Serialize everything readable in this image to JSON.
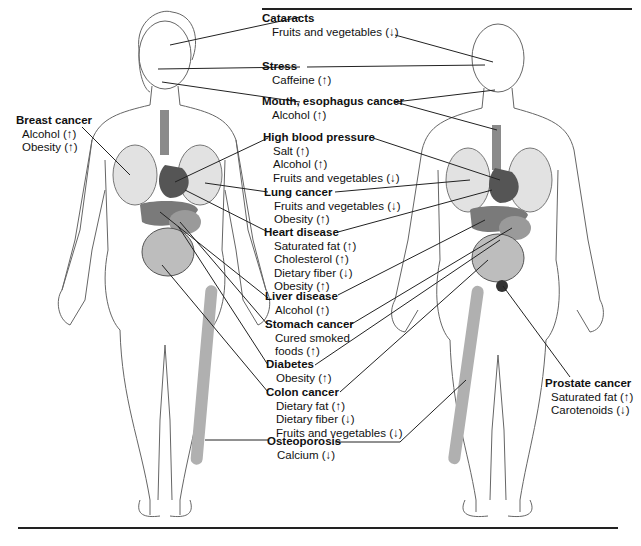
{
  "diagram": {
    "top_rule": true,
    "bottom_rule": true,
    "figures": [
      "female-body",
      "male-body"
    ],
    "arrow_legend": {
      "up": "↑",
      "down": "↓"
    },
    "labels": [
      {
        "id": "cataracts",
        "title": "Cataracts",
        "factors": [
          "Fruits and vegetables (↓)"
        ]
      },
      {
        "id": "stress",
        "title": "Stress",
        "factors": [
          "Caffeine (↑)"
        ]
      },
      {
        "id": "mouth-esophagus-cancer",
        "title": "Mouth, esophagus cancer",
        "factors": [
          "Alcohol (↑)"
        ]
      },
      {
        "id": "high-blood-pressure",
        "title": "High blood pressure",
        "factors": [
          "Salt (↑)",
          "Alcohol (↑)",
          "Fruits and vegetables (↓)"
        ]
      },
      {
        "id": "lung-cancer",
        "title": "Lung cancer",
        "factors": [
          "Fruits and vegetables (↓)",
          "Obesity (↑)"
        ]
      },
      {
        "id": "heart-disease",
        "title": "Heart disease",
        "factors": [
          "Saturated fat (↑)",
          "Cholesterol (↑)",
          "Dietary fiber (↓)",
          "Obesity (↑)"
        ]
      },
      {
        "id": "liver-disease",
        "title": "Liver disease",
        "factors": [
          "Alcohol (↑)"
        ]
      },
      {
        "id": "stomach-cancer",
        "title": "Stomach cancer",
        "factors": [
          "Cured smoked",
          "foods (↑)"
        ]
      },
      {
        "id": "diabetes",
        "title": "Diabetes",
        "factors": [
          "Obesity (↑)"
        ]
      },
      {
        "id": "colon-cancer",
        "title": "Colon cancer",
        "factors": [
          "Dietary fat (↑)",
          "Dietary fiber (↓)",
          "Fruits and vegetables (↓)"
        ]
      },
      {
        "id": "osteoporosis",
        "title": "Osteoporosis",
        "factors": [
          "Calcium (↓)"
        ]
      },
      {
        "id": "breast-cancer",
        "title": "Breast cancer",
        "factors": [
          "Alcohol (↑)",
          "Obesity (↑)"
        ]
      },
      {
        "id": "prostate-cancer",
        "title": "Prostate cancer",
        "factors": [
          "Saturated fat (↑)",
          "Carotenoids (↓)"
        ]
      }
    ],
    "colors": {
      "line": "#222222",
      "organ_dark": "#555555",
      "organ_mid": "#8a8a8a",
      "organ_light": "#d8d8d8",
      "skin_outline": "#666666"
    }
  }
}
